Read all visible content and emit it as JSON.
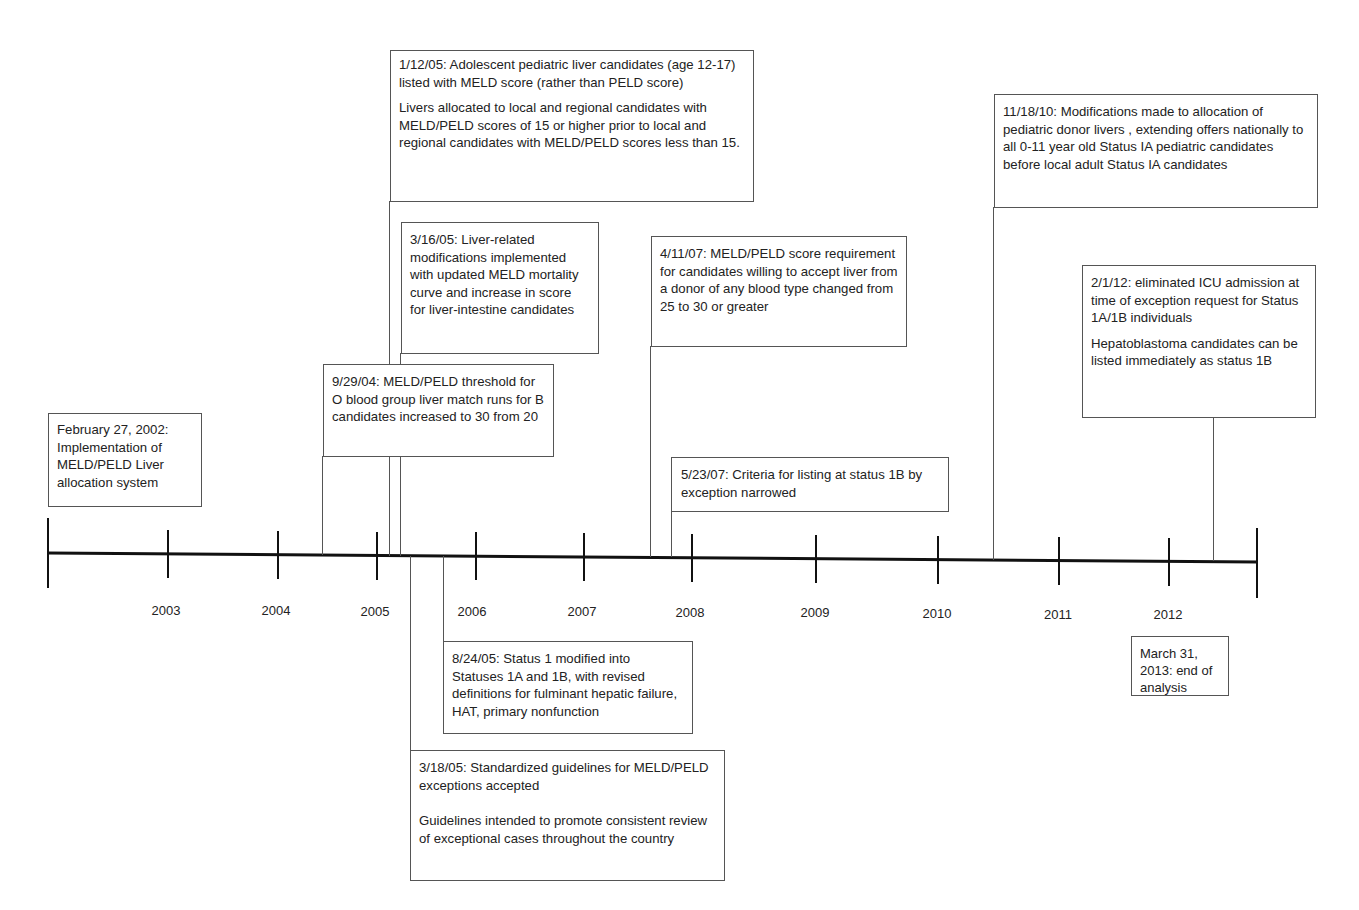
{
  "timeline": {
    "start_label": "2002",
    "end_label": "2013",
    "years": [
      "2003",
      "2004",
      "2005",
      "2006",
      "2007",
      "2008",
      "2009",
      "2010",
      "2011",
      "2012"
    ]
  },
  "events": {
    "e2002": {
      "lines": [
        "February 27, 2002: Implementation of MELD/PELD Liver allocation system"
      ]
    },
    "e2005a": {
      "lines": [
        "1/12/05: Adolescent pediatric liver candidates (age 12-17) listed with MELD score (rather than PELD score)",
        "Livers allocated to local and regional candidates with  MELD/PELD scores of 15 or higher prior to local and regional candidates with MELD/PELD scores less than 15."
      ]
    },
    "e2005b": {
      "lines": [
        "3/16/05: Liver-related modifications implemented with updated MELD mortality curve and increase in score for liver-intestine candidates"
      ]
    },
    "e2004": {
      "lines": [
        "9/29/04: MELD/PELD threshold for O blood group liver match runs for B candidates increased to 30 from 20"
      ]
    },
    "e2007a": {
      "lines": [
        "4/11/07: MELD/PELD score requirement for candidates willing to accept liver from a donor of any blood type changed from 25 to 30 or greater"
      ]
    },
    "e2007b": {
      "lines": [
        "5/23/07: Criteria for listing at status 1B by exception narrowed"
      ]
    },
    "e2010": {
      "lines": [
        "11/18/10: Modifications made to allocation of pediatric donor livers , extending offers nationally to all 0-11 year old Status IA pediatric candidates before local adult Status IA candidates"
      ]
    },
    "e2012": {
      "lines": [
        "2/1/12: eliminated ICU admission at time of exception request for Status 1A/1B individuals",
        "Hepatoblastoma candidates can be listed immediately as status 1B"
      ]
    },
    "e2005c": {
      "lines": [
        "8/24/05: Status 1 modified into Statuses 1A and 1B, with revised definitions for fulminant hepatic failure, HAT, primary nonfunction"
      ]
    },
    "e2005d": {
      "lines": [
        "3/18/05: Standardized guidelines for MELD/PELD exceptions accepted",
        "Guidelines intended to promote consistent review of exceptional cases throughout the country"
      ]
    },
    "e2013": {
      "lines": [
        "March 31, 2013: end of analysis"
      ]
    }
  }
}
